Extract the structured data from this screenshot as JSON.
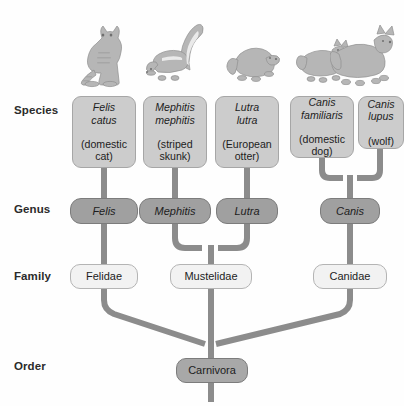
{
  "diagram": {
    "background_color": "#fefefe",
    "connector_color": "#8c8c8c"
  },
  "ranks": [
    {
      "id": "species",
      "label": "Species"
    },
    {
      "id": "genus",
      "label": "Genus"
    },
    {
      "id": "family",
      "label": "Family"
    },
    {
      "id": "order",
      "label": "Order"
    }
  ],
  "species": [
    {
      "id": "felis-catus",
      "scientific": "Felis\ncatus",
      "common": "(domestic\ncat)",
      "fill": "#cccccc"
    },
    {
      "id": "mephitis-mephitis",
      "scientific": "Mephitis\nmephitis",
      "common": "(striped\nskunk)",
      "fill": "#cccccc"
    },
    {
      "id": "lutra-lutra",
      "scientific": "Lutra\nlutra",
      "common": "(European\notter)",
      "fill": "#cccccc"
    },
    {
      "id": "canis-familiaris",
      "scientific": "Canis\nfamiliaris",
      "common": "(domestic\ndog)",
      "fill": "#cccccc"
    },
    {
      "id": "canis-lupus",
      "scientific": "Canis\nlupus",
      "common": "(wolf)",
      "fill": "#cccccc"
    }
  ],
  "genera": [
    {
      "id": "felis",
      "label": "Felis",
      "fill": "#a0a0a0"
    },
    {
      "id": "mephitis",
      "label": "Mephitis",
      "fill": "#a0a0a0"
    },
    {
      "id": "lutra",
      "label": "Lutra",
      "fill": "#a0a0a0"
    },
    {
      "id": "canis",
      "label": "Canis",
      "fill": "#a0a0a0"
    }
  ],
  "families": [
    {
      "id": "felidae",
      "label": "Felidae",
      "fill": "#f2f2f2"
    },
    {
      "id": "mustelidae",
      "label": "Mustelidae",
      "fill": "#f2f2f2"
    },
    {
      "id": "canidae",
      "label": "Canidae",
      "fill": "#f2f2f2"
    }
  ],
  "order": {
    "id": "carnivora",
    "label": "Carnivora",
    "fill": "#a8a8a8"
  },
  "illustrations": [
    {
      "id": "cat",
      "name": "cat-illustration",
      "subject": "sitting domestic cat"
    },
    {
      "id": "skunk",
      "name": "skunk-illustration",
      "subject": "striped skunk with raised tail"
    },
    {
      "id": "otter",
      "name": "otter-illustration",
      "subject": "European otter"
    },
    {
      "id": "dog",
      "name": "dog-illustration",
      "subject": "domestic dog"
    },
    {
      "id": "wolf",
      "name": "wolf-illustration",
      "subject": "wolf"
    }
  ]
}
